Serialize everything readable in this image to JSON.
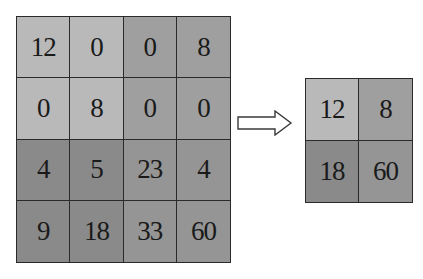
{
  "diagram": {
    "type": "max-pooling",
    "input": {
      "rows": 4,
      "cols": 4,
      "values": [
        [
          "12",
          "0",
          "0",
          "8"
        ],
        [
          "0",
          "8",
          "0",
          "0"
        ],
        [
          "4",
          "5",
          "23",
          "4"
        ],
        [
          "9",
          "18",
          "33",
          "60"
        ]
      ],
      "colors": [
        [
          "#b9b9b9",
          "#b9b9b9",
          "#9f9f9f",
          "#9f9f9f"
        ],
        [
          "#b9b9b9",
          "#b9b9b9",
          "#9f9f9f",
          "#9f9f9f"
        ],
        [
          "#8a8a8a",
          "#8a8a8a",
          "#959595",
          "#959595"
        ],
        [
          "#8a8a8a",
          "#8a8a8a",
          "#959595",
          "#959595"
        ]
      ]
    },
    "arrow": {
      "icon": "right-arrow-icon",
      "direction": "right"
    },
    "output": {
      "rows": 2,
      "cols": 2,
      "values": [
        [
          "12",
          "8"
        ],
        [
          "18",
          "60"
        ]
      ],
      "colors": [
        [
          "#b9b9b9",
          "#9f9f9f"
        ],
        [
          "#8a8a8a",
          "#959595"
        ]
      ]
    }
  }
}
